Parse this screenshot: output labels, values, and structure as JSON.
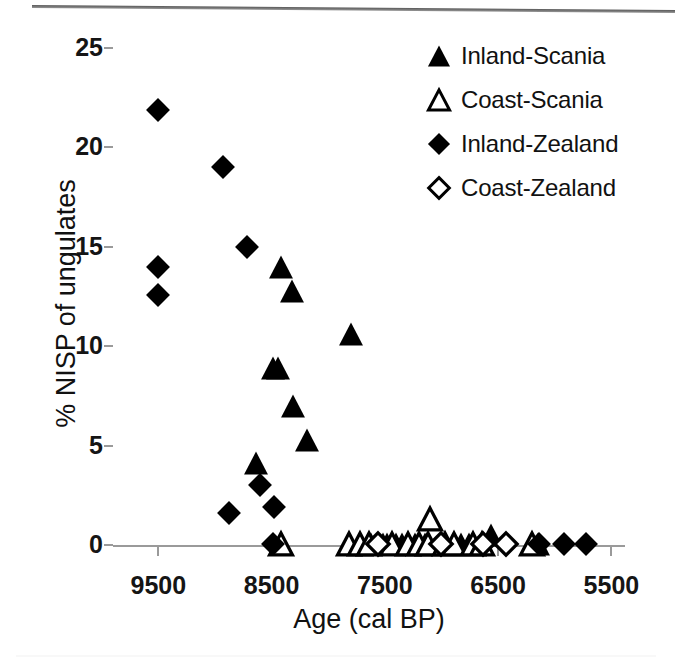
{
  "chart_data": {
    "type": "scatter",
    "title": "",
    "xlabel": "Age  (cal BP)",
    "ylabel": "% NISP of ungulates",
    "xlim": [
      9900,
      5380
    ],
    "ylim": [
      0,
      25
    ],
    "x_inverted": true,
    "grid": false,
    "legend_position": "top-right",
    "xticks": [
      9500,
      8500,
      7500,
      6500,
      5500
    ],
    "xtick_labels": [
      "9500",
      "8500",
      "7500",
      "6500",
      "5500"
    ],
    "yticks": [
      0,
      5,
      10,
      15,
      20,
      25
    ],
    "ytick_labels": [
      "0",
      "5",
      "10",
      "15",
      "20",
      "25"
    ],
    "series": [
      {
        "name": "Inland-Scania",
        "marker": "filled-triangle",
        "color": "#000000",
        "points": [
          [
            8420,
            14.0
          ],
          [
            8320,
            12.8
          ],
          [
            7800,
            10.6
          ],
          [
            8490,
            8.9
          ],
          [
            8440,
            8.9
          ],
          [
            8310,
            7.0
          ],
          [
            8190,
            5.3
          ],
          [
            8640,
            4.1
          ],
          [
            7620,
            0.05
          ],
          [
            7520,
            0.05
          ],
          [
            7480,
            0.05
          ],
          [
            7400,
            0.05
          ],
          [
            7350,
            0.05
          ],
          [
            7230,
            0.05
          ],
          [
            7150,
            0.05
          ],
          [
            6900,
            0.05
          ],
          [
            6830,
            0.05
          ],
          [
            6760,
            0.05
          ],
          [
            6560,
            0.5
          ],
          [
            6150,
            0.05
          ]
        ]
      },
      {
        "name": "Coast-Scania",
        "marker": "open-triangle",
        "color": "#000000",
        "points": [
          [
            7100,
            1.3
          ],
          [
            8420,
            0.05
          ],
          [
            7820,
            0.05
          ],
          [
            7720,
            0.05
          ],
          [
            7640,
            0.05
          ],
          [
            7440,
            0.05
          ],
          [
            7300,
            0.05
          ],
          [
            7200,
            0.05
          ],
          [
            7120,
            0.05
          ],
          [
            6970,
            0.05
          ],
          [
            6890,
            0.05
          ],
          [
            6720,
            0.05
          ],
          [
            6640,
            0.05
          ],
          [
            6200,
            0.05
          ]
        ]
      },
      {
        "name": "Inland-Zealand",
        "marker": "filled-diamond",
        "color": "#000000",
        "points": [
          [
            9500,
            21.9
          ],
          [
            9500,
            14.0
          ],
          [
            9500,
            12.6
          ],
          [
            8930,
            19.0
          ],
          [
            8720,
            15.0
          ],
          [
            8600,
            3.0
          ],
          [
            8480,
            1.9
          ],
          [
            8880,
            1.6
          ],
          [
            8490,
            0.05
          ],
          [
            6140,
            0.05
          ],
          [
            5920,
            0.05
          ],
          [
            5720,
            0.05
          ]
        ]
      },
      {
        "name": "Coast-Zealand",
        "marker": "open-diamond",
        "color": "#000000",
        "points": [
          [
            7560,
            0.05
          ],
          [
            7000,
            0.05
          ],
          [
            6630,
            0.05
          ],
          [
            6430,
            0.05
          ]
        ]
      }
    ]
  },
  "legend": {
    "items": [
      {
        "label": "Inland-Scania",
        "marker": "filled-triangle"
      },
      {
        "label": "Coast-Scania",
        "marker": "open-triangle"
      },
      {
        "label": "Inland-Zealand",
        "marker": "filled-diamond"
      },
      {
        "label": "Coast-Zealand",
        "marker": "open-diamond"
      }
    ]
  },
  "colors": {
    "marker": "#000000",
    "axis": "#9a9a9a",
    "text": "#111111",
    "background": "#ffffff"
  }
}
